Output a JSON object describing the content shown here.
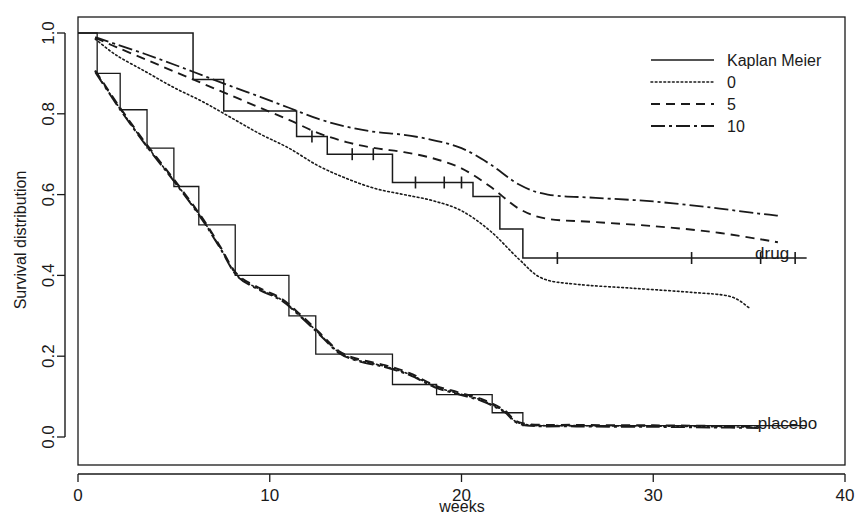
{
  "chart_data": {
    "type": "line",
    "title": "",
    "xlabel": "weeks",
    "ylabel": "Survival distribution",
    "xlim": [
      0,
      40
    ],
    "ylim": [
      0,
      1
    ],
    "xticks": [
      "0",
      "10",
      "20",
      "30",
      "40"
    ],
    "xtick_values": [
      0,
      10,
      20,
      30,
      40
    ],
    "yticks": [
      "0.0",
      "0.2",
      "0.4",
      "0.6",
      "0.8",
      "1.0"
    ],
    "ytick_values": [
      0.0,
      0.2,
      0.4,
      0.6,
      0.8,
      1.0
    ],
    "grid": false,
    "legend_position": "top-right",
    "legend": [
      {
        "label": "Kaplan Meier",
        "style": "solid"
      },
      {
        "label": "0",
        "style": "dotted"
      },
      {
        "label": "5",
        "style": "dashed"
      },
      {
        "label": "10",
        "style": "dashdot"
      }
    ],
    "annotations": [
      {
        "text": "drug",
        "x": 36.2,
        "y": 0.455
      },
      {
        "text": "placebo",
        "x": 37.0,
        "y": 0.035
      }
    ],
    "series": [
      {
        "name": "drug Kaplan Meier",
        "group": "drug",
        "style": "solid",
        "type": "step",
        "points": [
          [
            0,
            1.0
          ],
          [
            6.0,
            1.0
          ],
          [
            6.0,
            0.885
          ],
          [
            7.6,
            0.885
          ],
          [
            7.6,
            0.807
          ],
          [
            11.4,
            0.807
          ],
          [
            11.4,
            0.744
          ],
          [
            13.0,
            0.744
          ],
          [
            13.0,
            0.7
          ],
          [
            16.4,
            0.7
          ],
          [
            16.4,
            0.63
          ],
          [
            20.6,
            0.63
          ],
          [
            20.6,
            0.595
          ],
          [
            22.0,
            0.595
          ],
          [
            22.0,
            0.515
          ],
          [
            23.2,
            0.515
          ],
          [
            23.2,
            0.443
          ],
          [
            38.0,
            0.443
          ]
        ],
        "censor_marks": [
          [
            12.2,
            0.744
          ],
          [
            14.3,
            0.7
          ],
          [
            15.4,
            0.7
          ],
          [
            17.6,
            0.63
          ],
          [
            19.1,
            0.63
          ],
          [
            20.0,
            0.63
          ],
          [
            25.0,
            0.443
          ],
          [
            32.0,
            0.443
          ],
          [
            35.6,
            0.443
          ],
          [
            37.4,
            0.443
          ]
        ]
      },
      {
        "name": "drug smoothed bandwidth 0",
        "group": "drug",
        "style": "dotted",
        "type": "smooth",
        "points": [
          [
            0.9,
            0.985
          ],
          [
            2.0,
            0.945
          ],
          [
            3.5,
            0.905
          ],
          [
            5.0,
            0.865
          ],
          [
            6.5,
            0.83
          ],
          [
            8.0,
            0.79
          ],
          [
            9.5,
            0.75
          ],
          [
            11.0,
            0.715
          ],
          [
            12.5,
            0.672
          ],
          [
            14.0,
            0.64
          ],
          [
            15.5,
            0.615
          ],
          [
            17.0,
            0.6
          ],
          [
            18.5,
            0.585
          ],
          [
            20.0,
            0.56
          ],
          [
            21.5,
            0.51
          ],
          [
            23.0,
            0.44
          ],
          [
            24.2,
            0.393
          ],
          [
            26.0,
            0.378
          ],
          [
            29.0,
            0.368
          ],
          [
            32.0,
            0.358
          ],
          [
            34.0,
            0.348
          ],
          [
            35.0,
            0.32
          ]
        ]
      },
      {
        "name": "drug smoothed bandwidth 5",
        "group": "drug",
        "style": "dashed",
        "type": "smooth",
        "points": [
          [
            0.9,
            0.988
          ],
          [
            2.0,
            0.965
          ],
          [
            3.5,
            0.935
          ],
          [
            5.0,
            0.905
          ],
          [
            6.5,
            0.875
          ],
          [
            8.0,
            0.845
          ],
          [
            9.5,
            0.815
          ],
          [
            11.0,
            0.785
          ],
          [
            12.5,
            0.753
          ],
          [
            14.0,
            0.73
          ],
          [
            15.5,
            0.715
          ],
          [
            17.0,
            0.705
          ],
          [
            18.5,
            0.69
          ],
          [
            20.0,
            0.665
          ],
          [
            21.5,
            0.62
          ],
          [
            23.0,
            0.565
          ],
          [
            24.5,
            0.54
          ],
          [
            27.0,
            0.532
          ],
          [
            30.0,
            0.522
          ],
          [
            33.0,
            0.508
          ],
          [
            35.5,
            0.49
          ],
          [
            36.5,
            0.482
          ]
        ]
      },
      {
        "name": "drug smoothed bandwidth 10",
        "group": "drug",
        "style": "dashdot",
        "type": "smooth",
        "points": [
          [
            0.9,
            0.99
          ],
          [
            2.0,
            0.972
          ],
          [
            3.5,
            0.948
          ],
          [
            5.0,
            0.922
          ],
          [
            6.5,
            0.895
          ],
          [
            8.0,
            0.868
          ],
          [
            9.5,
            0.842
          ],
          [
            11.0,
            0.815
          ],
          [
            12.5,
            0.788
          ],
          [
            14.0,
            0.768
          ],
          [
            15.5,
            0.755
          ],
          [
            17.0,
            0.748
          ],
          [
            18.5,
            0.735
          ],
          [
            20.0,
            0.715
          ],
          [
            21.5,
            0.675
          ],
          [
            23.0,
            0.625
          ],
          [
            24.5,
            0.6
          ],
          [
            27.0,
            0.592
          ],
          [
            30.0,
            0.583
          ],
          [
            33.0,
            0.568
          ],
          [
            35.5,
            0.553
          ],
          [
            36.5,
            0.548
          ]
        ]
      },
      {
        "name": "placebo Kaplan Meier",
        "group": "placebo",
        "style": "solid",
        "type": "step",
        "points": [
          [
            0,
            1.0
          ],
          [
            1.0,
            1.0
          ],
          [
            1.0,
            0.9
          ],
          [
            2.2,
            0.9
          ],
          [
            2.2,
            0.81
          ],
          [
            3.6,
            0.81
          ],
          [
            3.6,
            0.715
          ],
          [
            5.0,
            0.715
          ],
          [
            5.0,
            0.62
          ],
          [
            6.3,
            0.62
          ],
          [
            6.3,
            0.525
          ],
          [
            8.2,
            0.525
          ],
          [
            8.2,
            0.4
          ],
          [
            11.0,
            0.4
          ],
          [
            11.0,
            0.3
          ],
          [
            12.4,
            0.3
          ],
          [
            12.4,
            0.205
          ],
          [
            16.4,
            0.205
          ],
          [
            16.4,
            0.13
          ],
          [
            18.7,
            0.13
          ],
          [
            18.7,
            0.105
          ],
          [
            21.6,
            0.105
          ],
          [
            21.6,
            0.06
          ],
          [
            23.2,
            0.06
          ],
          [
            23.2,
            0.028
          ],
          [
            38.0,
            0.028
          ]
        ],
        "censor_marks": []
      },
      {
        "name": "placebo smoothed bandwidth 0",
        "group": "placebo",
        "style": "dotted",
        "type": "smooth",
        "points": [
          [
            0.9,
            0.905
          ],
          [
            2.2,
            0.812
          ],
          [
            3.6,
            0.72
          ],
          [
            5.0,
            0.635
          ],
          [
            6.4,
            0.545
          ],
          [
            7.4,
            0.47
          ],
          [
            8.3,
            0.4
          ],
          [
            9.5,
            0.365
          ],
          [
            10.6,
            0.34
          ],
          [
            11.6,
            0.3
          ],
          [
            12.6,
            0.255
          ],
          [
            13.6,
            0.21
          ],
          [
            14.6,
            0.19
          ],
          [
            16.0,
            0.175
          ],
          [
            17.3,
            0.155
          ],
          [
            18.6,
            0.125
          ],
          [
            19.8,
            0.108
          ],
          [
            21.0,
            0.092
          ],
          [
            22.2,
            0.065
          ],
          [
            23.2,
            0.032
          ],
          [
            26.0,
            0.028
          ],
          [
            30.0,
            0.027
          ],
          [
            34.0,
            0.025
          ],
          [
            35.5,
            0.024
          ]
        ]
      },
      {
        "name": "placebo smoothed bandwidth 5",
        "group": "placebo",
        "style": "dashed",
        "type": "smooth",
        "points": [
          [
            0.9,
            0.907
          ],
          [
            2.2,
            0.815
          ],
          [
            3.6,
            0.723
          ],
          [
            5.0,
            0.638
          ],
          [
            6.4,
            0.548
          ],
          [
            7.4,
            0.473
          ],
          [
            8.3,
            0.403
          ],
          [
            9.5,
            0.368
          ],
          [
            10.6,
            0.343
          ],
          [
            11.6,
            0.303
          ],
          [
            12.6,
            0.258
          ],
          [
            13.6,
            0.213
          ],
          [
            14.6,
            0.193
          ],
          [
            16.0,
            0.178
          ],
          [
            17.3,
            0.158
          ],
          [
            18.6,
            0.128
          ],
          [
            19.8,
            0.111
          ],
          [
            21.0,
            0.095
          ],
          [
            22.2,
            0.068
          ],
          [
            23.2,
            0.034
          ],
          [
            26.0,
            0.03
          ],
          [
            30.0,
            0.029
          ],
          [
            34.0,
            0.027
          ],
          [
            35.5,
            0.026
          ]
        ]
      },
      {
        "name": "placebo smoothed bandwidth 10",
        "group": "placebo",
        "style": "dashdot",
        "type": "smooth",
        "points": [
          [
            0.9,
            0.903
          ],
          [
            2.2,
            0.81
          ],
          [
            3.6,
            0.718
          ],
          [
            5.0,
            0.633
          ],
          [
            6.4,
            0.543
          ],
          [
            7.4,
            0.468
          ],
          [
            8.3,
            0.398
          ],
          [
            9.5,
            0.363
          ],
          [
            10.6,
            0.338
          ],
          [
            11.6,
            0.298
          ],
          [
            12.6,
            0.253
          ],
          [
            13.6,
            0.208
          ],
          [
            14.6,
            0.188
          ],
          [
            16.0,
            0.173
          ],
          [
            17.3,
            0.153
          ],
          [
            18.6,
            0.123
          ],
          [
            19.8,
            0.106
          ],
          [
            21.0,
            0.09
          ],
          [
            22.2,
            0.063
          ],
          [
            23.2,
            0.03
          ],
          [
            26.0,
            0.026
          ],
          [
            30.0,
            0.025
          ],
          [
            34.0,
            0.023
          ],
          [
            35.5,
            0.022
          ]
        ]
      }
    ]
  }
}
